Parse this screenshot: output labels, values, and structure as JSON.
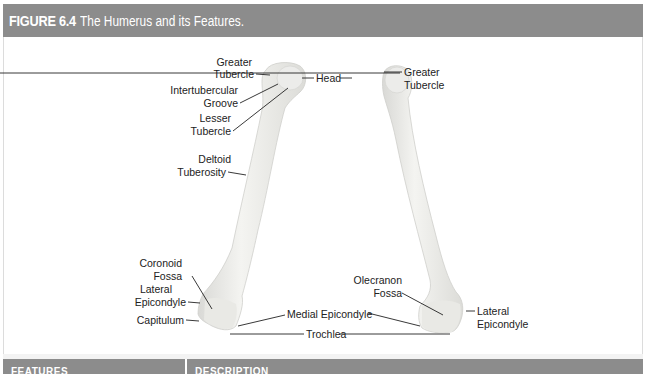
{
  "figure": {
    "number": "FIGURE 6.4",
    "title": "The Humerus and its Features.",
    "header_color": "#8c8c8c"
  },
  "anterior_labels": {
    "greater_tubercle": [
      "Greater",
      "Tubercle"
    ],
    "head": "Head",
    "intertubercular_groove": [
      "Intertubercular",
      "Groove"
    ],
    "lesser_tubercle": [
      "Lesser",
      "Tubercle"
    ],
    "deltoid_tuberosity": [
      "Deltoid",
      "Tuberosity"
    ],
    "coronoid_fossa": [
      "Coronoid",
      "Fossa"
    ],
    "lateral_epicondyle": [
      "Lateral",
      "Epicondyle"
    ],
    "capitulum": "Capitulum",
    "medial_epicondyle": "Medial Epicondyle",
    "trochlea": "Trochlea"
  },
  "posterior_labels": {
    "greater_tubercle": [
      "Greater",
      "Tubercle"
    ],
    "olecranon_fossa": [
      "Olecranon",
      "Fossa"
    ],
    "lateral_epicondyle": [
      "Lateral",
      "Epicondyle"
    ]
  },
  "table": {
    "columns": [
      "FEATURES",
      "DESCRIPTION"
    ]
  }
}
